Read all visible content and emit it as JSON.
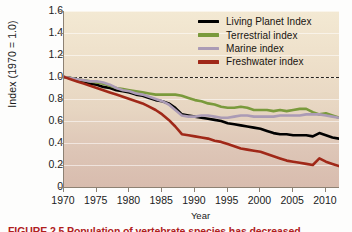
{
  "figure": {
    "caption": "FIGURE 2.5 Population of vertebrate species has decreased"
  },
  "chart_data": {
    "type": "line",
    "title": "",
    "xlabel": "Year",
    "ylabel": "Index (1970 = 1.0)",
    "xlim": [
      1970,
      2012
    ],
    "ylim": [
      0,
      1.6
    ],
    "xticks": [
      1970,
      1975,
      1980,
      1985,
      1990,
      1995,
      2000,
      2005,
      2010
    ],
    "yticks": [
      "0",
      "0.2",
      "0.4",
      "0.6",
      "0.8",
      "1.0",
      "1.2",
      "1.4",
      "1.6"
    ],
    "grid": "horizontal",
    "legend_position": "top-right",
    "reference_line": {
      "value": 1.0,
      "style": "dashed",
      "color": "#26211c"
    },
    "x": [
      1970,
      1971,
      1972,
      1973,
      1974,
      1975,
      1976,
      1977,
      1978,
      1979,
      1980,
      1981,
      1982,
      1983,
      1984,
      1985,
      1986,
      1987,
      1988,
      1989,
      1990,
      1991,
      1992,
      1993,
      1994,
      1995,
      1996,
      1997,
      1998,
      1999,
      2000,
      2001,
      2002,
      2003,
      2004,
      2005,
      2006,
      2007,
      2008,
      2009,
      2010,
      2011,
      2012
    ],
    "series": [
      {
        "name": "Living Planet Index",
        "color": "#000000",
        "values": [
          1.0,
          0.99,
          0.97,
          0.96,
          0.94,
          0.93,
          0.91,
          0.9,
          0.88,
          0.87,
          0.86,
          0.84,
          0.83,
          0.81,
          0.79,
          0.78,
          0.76,
          0.72,
          0.66,
          0.65,
          0.64,
          0.63,
          0.62,
          0.61,
          0.6,
          0.58,
          0.57,
          0.56,
          0.55,
          0.54,
          0.53,
          0.51,
          0.49,
          0.48,
          0.48,
          0.47,
          0.47,
          0.47,
          0.46,
          0.49,
          0.47,
          0.45,
          0.44
        ]
      },
      {
        "name": "Terrestrial index",
        "color": "#7a9a3c",
        "values": [
          1.0,
          0.99,
          0.98,
          0.97,
          0.96,
          0.95,
          0.94,
          0.92,
          0.9,
          0.89,
          0.88,
          0.87,
          0.86,
          0.85,
          0.84,
          0.84,
          0.84,
          0.84,
          0.83,
          0.81,
          0.79,
          0.78,
          0.76,
          0.75,
          0.73,
          0.72,
          0.72,
          0.73,
          0.72,
          0.7,
          0.7,
          0.7,
          0.69,
          0.7,
          0.69,
          0.7,
          0.71,
          0.71,
          0.68,
          0.66,
          0.67,
          0.65,
          0.63
        ]
      },
      {
        "name": "Marine index",
        "color": "#ab9bb5",
        "values": [
          1.0,
          0.99,
          0.98,
          0.97,
          0.96,
          0.96,
          0.95,
          0.93,
          0.9,
          0.88,
          0.87,
          0.85,
          0.84,
          0.82,
          0.8,
          0.78,
          0.75,
          0.7,
          0.65,
          0.64,
          0.64,
          0.65,
          0.65,
          0.64,
          0.63,
          0.63,
          0.64,
          0.65,
          0.65,
          0.64,
          0.64,
          0.64,
          0.64,
          0.65,
          0.65,
          0.65,
          0.65,
          0.66,
          0.66,
          0.66,
          0.65,
          0.64,
          0.63
        ]
      },
      {
        "name": "Freshwater index",
        "color": "#a02818",
        "values": [
          1.0,
          0.98,
          0.96,
          0.94,
          0.92,
          0.9,
          0.88,
          0.86,
          0.84,
          0.82,
          0.8,
          0.78,
          0.76,
          0.73,
          0.7,
          0.66,
          0.61,
          0.55,
          0.48,
          0.47,
          0.46,
          0.45,
          0.44,
          0.42,
          0.41,
          0.39,
          0.37,
          0.35,
          0.34,
          0.33,
          0.32,
          0.3,
          0.28,
          0.26,
          0.24,
          0.23,
          0.22,
          0.21,
          0.2,
          0.26,
          0.23,
          0.21,
          0.19
        ]
      }
    ]
  }
}
